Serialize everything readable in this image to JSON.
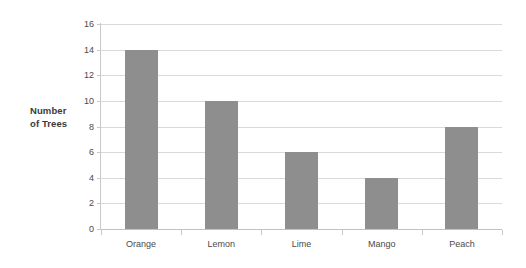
{
  "chart_data": {
    "type": "bar",
    "title": "",
    "xlabel": "",
    "ylabel": "Number of Trees",
    "ylabel_lines": [
      "Number",
      "of Trees"
    ],
    "categories": [
      "Orange",
      "Lemon",
      "Lime",
      "Mango",
      "Peach"
    ],
    "values": [
      14,
      10,
      6,
      4,
      8
    ],
    "ylim": [
      0,
      16
    ],
    "ytick_step": 2,
    "yticks": [
      16,
      14,
      12,
      10,
      8,
      6,
      4,
      2,
      0
    ],
    "grid": true,
    "grid_axis": "y",
    "legend": false,
    "legend_position": "none",
    "bar_color": "#8e8e8e",
    "gridline_color": "#d9d9d9",
    "axis_color": "#c9c9c9",
    "background_color": "#ffffff",
    "text_color": "#4a4a4a"
  }
}
